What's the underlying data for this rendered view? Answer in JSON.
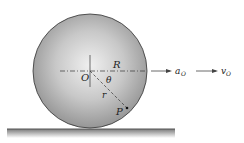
{
  "diagram": {
    "labels": {
      "center": "O",
      "radius_R": "R",
      "radius_r": "r",
      "angle": "θ",
      "point": "P",
      "accel": "a",
      "accel_sub": "O",
      "vel": "v",
      "vel_sub": "O"
    },
    "colors": {
      "wheel_light": "#f2f2f2",
      "wheel_dark": "#8a8a8a",
      "outline": "#333333",
      "ground": "#555555"
    }
  }
}
